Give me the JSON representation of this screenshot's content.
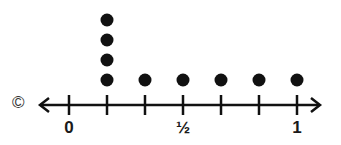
{
  "chart_data": {
    "type": "dot",
    "title": "",
    "xlabel": "",
    "ylabel": "",
    "xlim": [
      0,
      1
    ],
    "tick_step": "1/6",
    "ticks": [
      0,
      0.1667,
      0.3333,
      0.5,
      0.6667,
      0.8333,
      1
    ],
    "tick_labels": [
      {
        "value": 0,
        "label": "0"
      },
      {
        "value": 0.5,
        "label": "½"
      },
      {
        "value": 1,
        "label": "1"
      }
    ],
    "categories": [
      "1/6",
      "2/6",
      "3/6",
      "4/6",
      "5/6",
      "6/6"
    ],
    "values": [
      4,
      1,
      1,
      1,
      1,
      1
    ],
    "points": [
      {
        "x": "1/6",
        "count": 4
      },
      {
        "x": "2/6",
        "count": 1
      },
      {
        "x": "3/6",
        "count": 1
      },
      {
        "x": "4/6",
        "count": 1
      },
      {
        "x": "5/6",
        "count": 1
      },
      {
        "x": "1",
        "count": 1
      }
    ],
    "grid": false,
    "legend": null
  },
  "copyright_symbol": "©",
  "colors": {
    "ink": "#111111",
    "background": "#ffffff"
  }
}
